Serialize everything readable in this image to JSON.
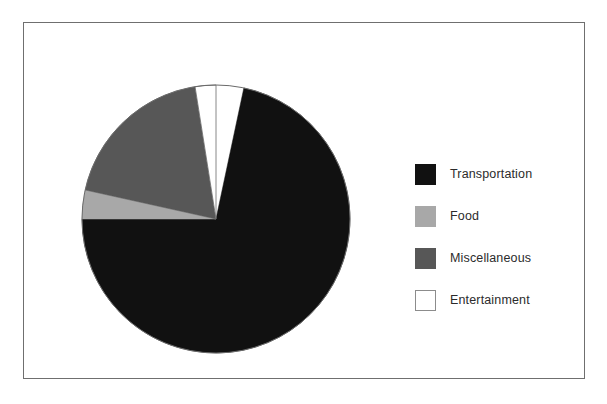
{
  "chart_data": {
    "type": "pie",
    "title": "",
    "subtitle": "",
    "xlabel": "",
    "ylabel": "",
    "legend_position": "right",
    "grid": false,
    "start_angle_deg": 0,
    "direction": "clockwise",
    "categories": [
      "Transportation",
      "Food",
      "Miscellaneous",
      "Entertainment"
    ],
    "values": [
      72,
      3.5,
      19,
      2.5
    ],
    "units": "percent",
    "colors": [
      "#111111",
      "#a8a8a8",
      "#575757",
      "#ffffff"
    ],
    "slices": [
      {
        "label": "Transportation",
        "value": 72,
        "color": "#111111",
        "start_angle_deg": 12,
        "end_angle_deg": 270
      },
      {
        "label": "Food",
        "value": 3.5,
        "color": "#a8a8a8",
        "start_angle_deg": 270,
        "end_angle_deg": 282.5
      },
      {
        "label": "Miscellaneous",
        "value": 19,
        "color": "#575757",
        "start_angle_deg": 282.5,
        "end_angle_deg": 351
      },
      {
        "label": "Entertainment",
        "value": 2.5,
        "color": "#ffffff",
        "start_angle_deg": 351,
        "end_angle_deg": 360
      }
    ]
  },
  "legend": {
    "items": [
      {
        "label": "Transportation",
        "color": "#111111",
        "border": "#111111"
      },
      {
        "label": "Food",
        "color": "#a8a8a8",
        "border": "#a8a8a8"
      },
      {
        "label": "Miscellaneous",
        "color": "#575757",
        "border": "#575757"
      },
      {
        "label": "Entertainment",
        "color": "#ffffff",
        "border": "#8c8c8c"
      }
    ]
  },
  "frame": {
    "border_color": "#6f6f6f",
    "background": "#ffffff"
  },
  "pie": {
    "center_x": 135,
    "center_y": 135,
    "radius": 134,
    "outline_color": "#6a6a6a"
  }
}
